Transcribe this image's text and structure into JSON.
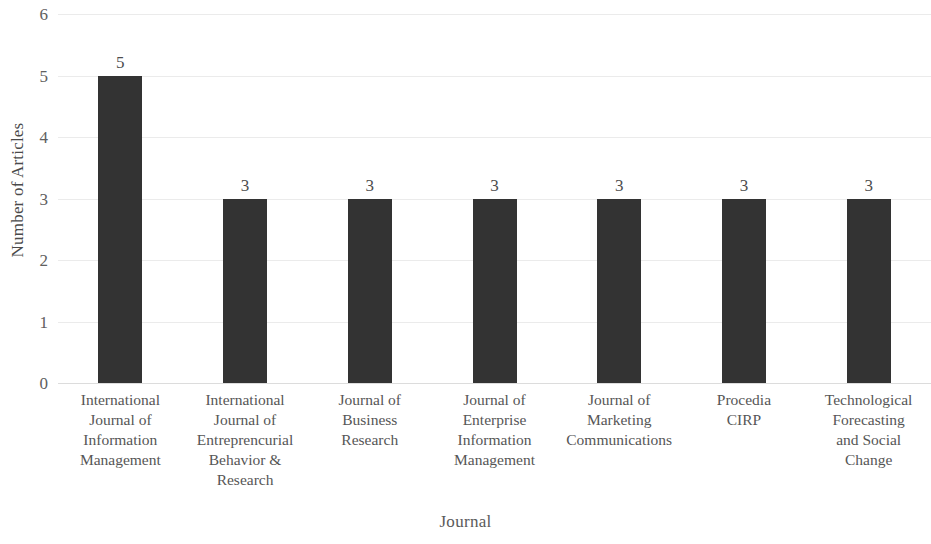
{
  "chart_data": {
    "type": "bar",
    "title": "",
    "xlabel": "Journal",
    "ylabel": "Number of Articles",
    "categories": [
      "International Journal of Information Management",
      "International Journal of Entreprencurial Behavior & Research",
      "Journal of Business Research",
      "Journal of Enterprise Information Management",
      "Journal of Marketing Communications",
      "Procedia CIRP",
      "Technological Forecasting and Social Change"
    ],
    "category_lines": [
      [
        "International",
        "Journal of",
        "Information",
        "Management"
      ],
      [
        "International",
        "Journal of",
        "Entreprencurial",
        "Behavior &",
        "Research"
      ],
      [
        "Journal of",
        "Business",
        "Research"
      ],
      [
        "Journal of",
        "Enterprise",
        "Information",
        "Management"
      ],
      [
        "Journal of",
        "Marketing",
        "Communications"
      ],
      [
        "Procedia",
        "CIRP"
      ],
      [
        "Technological",
        "Forecasting",
        "and Social",
        "Change"
      ]
    ],
    "values": [
      5,
      3,
      3,
      3,
      3,
      3,
      3
    ],
    "data_labels": [
      "5",
      "3",
      "3",
      "3",
      "3",
      "3",
      "3"
    ],
    "ylim": [
      0,
      6
    ],
    "ytick_labels": [
      "0",
      "1",
      "2",
      "3",
      "4",
      "5",
      "6"
    ],
    "ytick_values": [
      0,
      1,
      2,
      3,
      4,
      5,
      6
    ],
    "grid": true,
    "grid_axis": "y",
    "legend": false,
    "bar_color": "#333333",
    "gridline_color": "#ebebeb",
    "text_color": "#565656",
    "background_color": "#ffffff"
  }
}
